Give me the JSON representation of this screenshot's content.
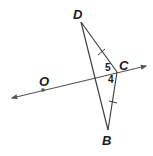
{
  "diagram": {
    "points": {
      "D": {
        "label": "D",
        "x": 81,
        "y": 22,
        "lx": 73,
        "ly": 19
      },
      "C": {
        "label": "C",
        "x": 117,
        "y": 72,
        "lx": 119,
        "ly": 70
      },
      "B": {
        "label": "B",
        "x": 108,
        "y": 130,
        "lx": 102,
        "ly": 145
      },
      "O": {
        "label": "O",
        "x": 43,
        "y": 90,
        "lx": 39,
        "ly": 86
      }
    },
    "line": {
      "x1": 12,
      "y1": 98,
      "x2": 146,
      "y2": 66
    },
    "angles": [
      {
        "label": "5",
        "x": 105,
        "y": 71
      },
      {
        "label": "4",
        "x": 108,
        "y": 83
      }
    ],
    "congruence_ticks": [
      {
        "segment": "DC",
        "x": 102,
        "y": 52
      },
      {
        "segment": "CB",
        "x": 113,
        "y": 102
      }
    ],
    "colors": {
      "stroke": "#3a3a3a",
      "text": "#1a1a1a"
    }
  }
}
